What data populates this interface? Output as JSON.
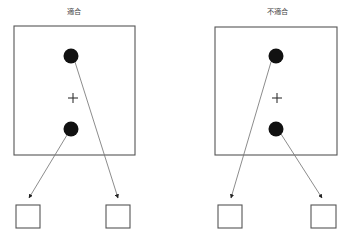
{
  "figure": {
    "title": "",
    "background_color": "#ffffff",
    "width": 347,
    "height": 235,
    "colors": {
      "frame_stroke": "#555555",
      "dot_fill": "#111111",
      "cross_stroke": "#333333",
      "arrow_stroke": "#777777",
      "arrow_head": "#222222",
      "label_text": "#444444",
      "box_fill": "#ffffff"
    }
  },
  "panels": [
    {
      "id": "compatible",
      "label": "適合",
      "frame": {
        "x": 14,
        "y": 26,
        "width": 121,
        "height": 129
      },
      "fixation": {
        "x": 73,
        "y": 98,
        "size": 9,
        "symbol": "+"
      },
      "stimuli": [
        {
          "id": "top-dot",
          "cx": 71,
          "cy": 56,
          "r": 7.5,
          "position": "top"
        },
        {
          "id": "bottom-dot",
          "cx": 71,
          "cy": 129,
          "r": 7.5,
          "position": "bottom"
        }
      ],
      "response_boxes": [
        {
          "id": "left-box",
          "x": 16,
          "y": 205,
          "width": 24,
          "height": 23,
          "position": "left"
        },
        {
          "id": "right-box",
          "x": 106,
          "y": 205,
          "width": 24,
          "height": 23,
          "position": "right"
        }
      ],
      "mappings": [
        {
          "from": "top-dot",
          "to": "right-box",
          "x1": 75,
          "y1": 62,
          "x2": 118,
          "y2": 200,
          "crossed": true
        },
        {
          "from": "bottom-dot",
          "to": "left-box",
          "x1": 67,
          "y1": 135,
          "x2": 29,
          "y2": 200,
          "crossed": true
        }
      ],
      "crossed": true
    },
    {
      "id": "incompatible",
      "label": "不適合",
      "frame": {
        "x": 215,
        "y": 27,
        "width": 122,
        "height": 128
      },
      "fixation": {
        "x": 277,
        "y": 98,
        "size": 9,
        "symbol": "+"
      },
      "stimuli": [
        {
          "id": "top-dot",
          "cx": 276,
          "cy": 56,
          "r": 7.5,
          "position": "top"
        },
        {
          "id": "bottom-dot",
          "cx": 276,
          "cy": 129,
          "r": 7.5,
          "position": "bottom"
        }
      ],
      "response_boxes": [
        {
          "id": "left-box",
          "x": 218,
          "y": 205,
          "width": 24,
          "height": 23,
          "position": "left"
        },
        {
          "id": "right-box",
          "x": 311,
          "y": 205,
          "width": 25,
          "height": 23,
          "position": "right"
        }
      ],
      "mappings": [
        {
          "from": "top-dot",
          "to": "left-box",
          "x1": 271,
          "y1": 62,
          "x2": 231,
          "y2": 200,
          "crossed": false
        },
        {
          "from": "bottom-dot",
          "to": "right-box",
          "x1": 281,
          "y1": 134,
          "x2": 323,
          "y2": 200,
          "crossed": false
        }
      ],
      "crossed": false
    }
  ],
  "labels": {
    "left_panel_title": "適合",
    "right_panel_title": "不適合"
  }
}
